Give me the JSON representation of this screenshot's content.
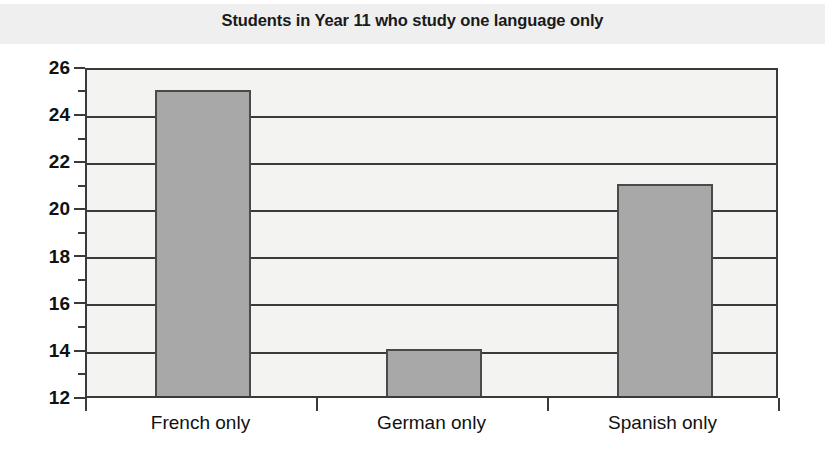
{
  "chart_data": {
    "type": "bar",
    "title": "Students in Year 11 who study one language only",
    "xlabel": "",
    "ylabel": "",
    "categories": [
      "French only",
      "German only",
      "Spanish only"
    ],
    "values": [
      25,
      14,
      21
    ],
    "ylim": [
      12,
      26
    ],
    "ytick_labels": [
      "12",
      "14",
      "16",
      "18",
      "20",
      "22",
      "24",
      "26"
    ],
    "ytick_values": [
      12,
      14,
      16,
      18,
      20,
      22,
      24,
      26
    ],
    "yminor_tick_values": [
      13,
      15,
      17,
      19,
      21,
      23,
      25
    ],
    "grid": true,
    "legend": false,
    "colors": {
      "bar_fill": "#a8a8a8",
      "bar_edge": "#4a4a4a",
      "plot_background": "#f3f3f1",
      "axis": "#3a3a3a",
      "title_band": "#efefef",
      "text": "#111111"
    }
  }
}
